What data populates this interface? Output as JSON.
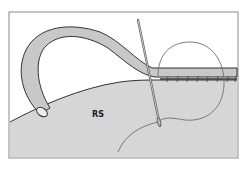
{
  "diagram": {
    "type": "surgical-illustration",
    "labels": {
      "region": "RS"
    },
    "elements": [
      "tube",
      "tissue-surface",
      "suture-line",
      "needle",
      "suture-thread"
    ],
    "colors": {
      "background": "#ffffff",
      "tissue": "#d4d4d4",
      "tube": "#c9c9c9",
      "outline": "#3a3a3a",
      "thread": "#6e6e6e",
      "frame": "#8a8a8a"
    }
  }
}
